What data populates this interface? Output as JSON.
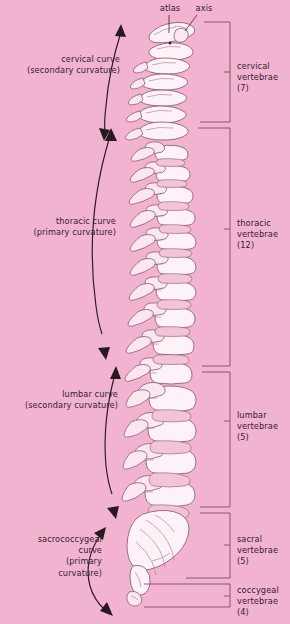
{
  "figure": {
    "background_color": "#f2b3d0",
    "bone_fill": "#fdf2f8",
    "outline_color": "#8c5a73",
    "ink_color": "#33242c"
  },
  "top_labels": [
    {
      "name": "atlas",
      "text": "atlas"
    },
    {
      "name": "axis",
      "text": "axis"
    }
  ],
  "curves": [
    {
      "name": "cervical-curve",
      "line1": "cervical curve",
      "line2": "(secondary curvature)"
    },
    {
      "name": "thoracic-curve",
      "line1": "thoracic curve",
      "line2": "(primary curvature)"
    },
    {
      "name": "lumbar-curve",
      "line1": "lumbar curve",
      "line2": "(secondary curvature)"
    },
    {
      "name": "sacrococcygeal-curve",
      "line1": "sacrococcygeal",
      "line2": "curve",
      "line3": "(primary",
      "line4": "curvature)"
    }
  ],
  "regions": [
    {
      "name": "cervical",
      "line1": "cervical",
      "line2": "vertebrae (7)",
      "count": 7
    },
    {
      "name": "thoracic",
      "line1": "thoracic",
      "line2": "vertebrae (12)",
      "count": 12
    },
    {
      "name": "lumbar",
      "line1": "lumbar",
      "line2": "vertebrae (5)",
      "count": 5
    },
    {
      "name": "sacral",
      "line1": "sacral",
      "line2": "vertebrae (5)",
      "count": 5
    },
    {
      "name": "coccygeal",
      "line1": "coccygeal",
      "line2": "vertebrae (4)",
      "count": 4
    }
  ]
}
